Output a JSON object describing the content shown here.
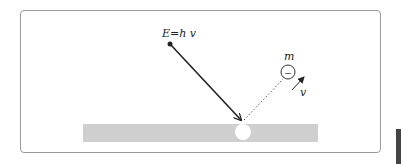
{
  "diagram": {
    "photon_label": "E=h v",
    "electron_mass_label": "m",
    "electron_charge_symbol": "−",
    "velocity_label": "v",
    "colors": {
      "frame": "#9a9a9a",
      "metal_plate": "#cfcfcf",
      "lines": "#222222"
    }
  }
}
